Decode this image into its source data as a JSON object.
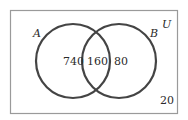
{
  "diagram": {
    "type": "venn",
    "universe_label": "U",
    "sets": [
      {
        "name": "A",
        "label": "A"
      },
      {
        "name": "B",
        "label": "B"
      }
    ],
    "regions": {
      "a_only": "740",
      "a_and_b": "160",
      "b_only": "80",
      "outside": "20"
    },
    "colors": {
      "stroke": "#444444",
      "border": "#9a9a9a",
      "text": "#2a2a2a",
      "background": "#ffffff"
    }
  }
}
